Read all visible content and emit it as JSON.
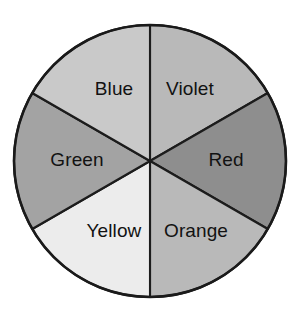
{
  "figure": {
    "name": "color-wheel",
    "background_color": "#ffffff",
    "outline_color": "#1a1a1a",
    "label_color": "#121212",
    "center_x": 150,
    "center_y": 161,
    "radius": 136,
    "sector_count": 6,
    "sector_angle_degrees": 60
  },
  "chart_data": {
    "type": "pie",
    "xlabel": "",
    "ylabel": "",
    "legend_position": "none",
    "grid": false,
    "categories": [
      "Violet",
      "Red",
      "Orange",
      "Yellow",
      "Green",
      "Blue"
    ],
    "values": [
      1,
      1,
      1,
      1,
      1,
      1
    ],
    "percentages": [
      16.67,
      16.67,
      16.67,
      16.67,
      16.67,
      16.67
    ],
    "slices": [
      {
        "label": "Violet",
        "value": 1,
        "percent": 16.67,
        "fill": "#b9b9b9",
        "start_angle": 0,
        "end_angle": 60,
        "label_x": 190,
        "label_y": 90
      },
      {
        "label": "Red",
        "value": 1,
        "percent": 16.67,
        "fill": "#8e8e8e",
        "start_angle": 60,
        "end_angle": 120,
        "label_x": 226,
        "label_y": 161
      },
      {
        "label": "Orange",
        "value": 1,
        "percent": 16.67,
        "fill": "#b9b9b9",
        "start_angle": 120,
        "end_angle": 180,
        "label_x": 196,
        "label_y": 232
      },
      {
        "label": "Yellow",
        "value": 1,
        "percent": 16.67,
        "fill": "#ececec",
        "start_angle": 180,
        "end_angle": 240,
        "label_x": 114,
        "label_y": 232
      },
      {
        "label": "Green",
        "value": 1,
        "percent": 16.67,
        "fill": "#a3a3a3",
        "start_angle": 240,
        "end_angle": 300,
        "label_x": 77,
        "label_y": 161
      },
      {
        "label": "Blue",
        "value": 1,
        "percent": 16.67,
        "fill": "#c9c9c9",
        "start_angle": 300,
        "end_angle": 360,
        "label_x": 114,
        "label_y": 90
      }
    ]
  }
}
